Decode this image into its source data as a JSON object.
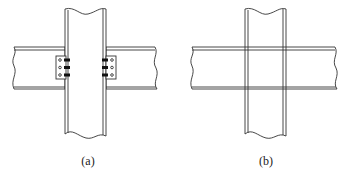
{
  "figures": [
    {
      "id": "a",
      "label": "(a)",
      "description": "Beam-to-column connection with bolted shear plates (beams not continuous through column)"
    },
    {
      "id": "b",
      "label": "(b)",
      "description": "Beam continuous across column (crossing members)"
    }
  ],
  "colors": {
    "line": "#333333",
    "fill": "#ffffff",
    "bolt": "#111111"
  }
}
